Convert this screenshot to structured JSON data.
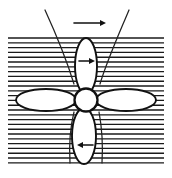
{
  "figure": {
    "background_color": "#ffffff",
    "ink_color": "#111111",
    "width": 172,
    "height": 178
  },
  "flow_field": {
    "name": "horizontal-hatching",
    "label": "Horizontal hatched flow region",
    "x": 8,
    "y": 37,
    "width": 156,
    "height": 128,
    "line_count": 27,
    "line_spacing": 4.8,
    "line_color": "#1a1a1a"
  },
  "hub": {
    "label": "Propeller hub",
    "center_x": 86,
    "center_y": 100,
    "radius": 11.5
  },
  "blades": [
    {
      "id": "blade-top",
      "label": "Upper blade",
      "orientation": "vertical-up",
      "center_x": 86,
      "center_y": 66,
      "rx": 11,
      "ry": 28
    },
    {
      "id": "blade-right",
      "label": "Right blade",
      "orientation": "horizontal-right",
      "center_x": 126,
      "center_y": 100,
      "rx": 30,
      "ry": 11
    },
    {
      "id": "blade-bottom",
      "label": "Lower blade",
      "orientation": "vertical-down",
      "center_x": 84,
      "center_y": 136,
      "rx": 12,
      "ry": 28
    },
    {
      "id": "blade-left",
      "label": "Left blade",
      "orientation": "horizontal-left",
      "center_x": 46,
      "center_y": 100,
      "rx": 30,
      "ry": 11
    }
  ],
  "arrows": [
    {
      "id": "arrow-freestream",
      "label": "Free-stream direction arrow",
      "direction": "right",
      "x1": 74,
      "y1": 23,
      "x2": 106,
      "y2": 23
    },
    {
      "id": "arrow-blade-top",
      "label": "Upper blade motion arrow",
      "direction": "right",
      "x1": 79,
      "y1": 61,
      "x2": 95,
      "y2": 61
    },
    {
      "id": "arrow-blade-bottom",
      "label": "Lower blade motion arrow",
      "direction": "left",
      "x1": 93,
      "y1": 145,
      "x2": 77,
      "y2": 145
    }
  ],
  "streamlines": [
    {
      "id": "streamline-left",
      "label": "Left streamline",
      "path": "M 45 10 C 56 34, 66 58, 74 84"
    },
    {
      "id": "streamline-right",
      "label": "Right streamline",
      "path": "M 129 10 C 119 34, 108 58, 100 84"
    },
    {
      "id": "streamline-left-lower",
      "label": "Left lower streamline",
      "path": "M 74 112 C 70 128, 69 146, 70 163"
    },
    {
      "id": "streamline-right-lower",
      "label": "Right lower streamline",
      "path": "M 99 112 C 102 128, 103 146, 102 163"
    }
  ]
}
